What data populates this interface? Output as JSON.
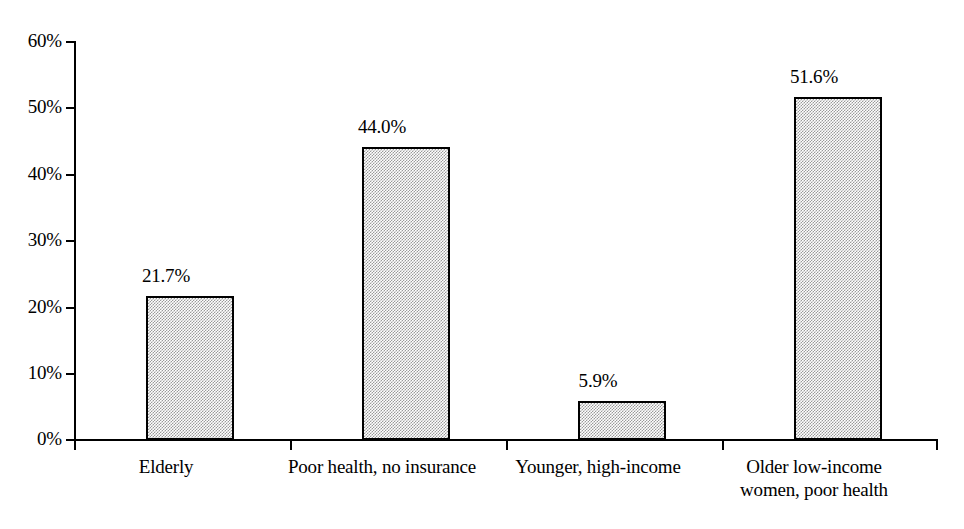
{
  "chart_data": {
    "type": "bar",
    "title": "",
    "subtitle": "",
    "xlabel": "",
    "ylabel": "",
    "ylim": [
      0,
      60
    ],
    "ytick_labels": [
      "0%",
      "10%",
      "20%",
      "30%",
      "40%",
      "50%",
      "60%"
    ],
    "ytick_values": [
      0,
      10,
      20,
      30,
      40,
      50,
      60
    ],
    "grid": false,
    "legend": false,
    "legend_position": "none",
    "categories": [
      "Elderly",
      "Poor health, no insurance",
      "Younger, high-income",
      "Older low-income\nwomen, poor health"
    ],
    "values": [
      21.7,
      44.0,
      5.9,
      51.6
    ],
    "value_labels": [
      "21.7%",
      "44.0%",
      "5.9%",
      "51.6%"
    ],
    "bar_fill_color": "#c0c0c0",
    "bar_edge_color": "#000000",
    "axis_color": "#000000",
    "background_color": "#ffffff"
  }
}
